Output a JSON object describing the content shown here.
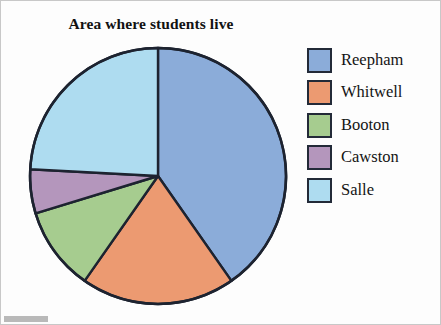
{
  "chart_data": {
    "type": "pie",
    "title": "Area where students live",
    "xlabel": "",
    "ylabel": "",
    "legend_position": "right",
    "grid": false,
    "categories": [
      "Reepham",
      "Whitwell",
      "Booton",
      "Cawston",
      "Salle"
    ],
    "values": [
      40.3,
      19.4,
      10.6,
      5.6,
      24.1
    ],
    "units": "percent",
    "start_angle_deg": 0,
    "direction": "clockwise",
    "slice_boundaries_deg": [
      0,
      145,
      215,
      253,
      273,
      360
    ],
    "colors": [
      "#8BACD9",
      "#EC9A71",
      "#A6CC8F",
      "#B496BC",
      "#AEDCF0"
    ],
    "slices": [
      {
        "label": "Reepham",
        "value": 40.3,
        "color": "#8BACD9",
        "start_deg": 0,
        "end_deg": 145
      },
      {
        "label": "Whitwell",
        "value": 19.4,
        "color": "#EC9A71",
        "start_deg": 145,
        "end_deg": 215
      },
      {
        "label": "Booton",
        "value": 10.6,
        "color": "#A6CC8F",
        "start_deg": 215,
        "end_deg": 253
      },
      {
        "label": "Cawston",
        "value": 5.6,
        "color": "#B496BC",
        "start_deg": 253,
        "end_deg": 273
      },
      {
        "label": "Salle",
        "value": 24.1,
        "color": "#AEDCF0",
        "start_deg": 273,
        "end_deg": 360
      }
    ]
  },
  "figure": {
    "title": "Area where students live",
    "outline_color": "#1d2330",
    "background": "#fdfdfd"
  },
  "legend": {
    "items": [
      {
        "label": "Reepham",
        "color": "#8BACD9"
      },
      {
        "label": "Whitwell",
        "color": "#EC9A71"
      },
      {
        "label": "Booton",
        "color": "#A6CC8F"
      },
      {
        "label": "Cawston",
        "color": "#B496BC"
      },
      {
        "label": "Salle",
        "color": "#AEDCF0"
      }
    ]
  }
}
